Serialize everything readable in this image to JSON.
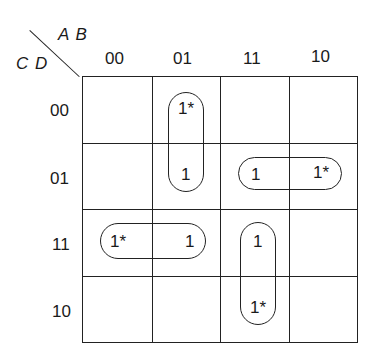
{
  "kmap": {
    "col_var": "A B",
    "row_var": "C D",
    "col_labels": [
      "00",
      "01",
      "11",
      "10"
    ],
    "row_labels": [
      "00",
      "01",
      "11",
      "10"
    ],
    "cells": [
      [
        "",
        "1*",
        "",
        ""
      ],
      [
        "",
        "1",
        "1",
        "1*"
      ],
      [
        "1*",
        "1",
        "",
        ""
      ],
      [
        "",
        "",
        "1",
        "1*"
      ]
    ],
    "values": {
      "r0c1": "1*",
      "r1c1": "1",
      "r1c2": "1",
      "r1c3": "1*",
      "r2c0": "1*",
      "r2c1": "1",
      "r2c2": "1",
      "r3c2": "1*"
    },
    "groupings": [
      {
        "cells": [
          "00/01",
          "01/01"
        ],
        "orientation": "vertical"
      },
      {
        "cells": [
          "01/11",
          "01/10"
        ],
        "orientation": "horizontal"
      },
      {
        "cells": [
          "11/00",
          "11/01"
        ],
        "orientation": "horizontal"
      },
      {
        "cells": [
          "11/11",
          "10/11"
        ],
        "orientation": "vertical"
      }
    ]
  }
}
